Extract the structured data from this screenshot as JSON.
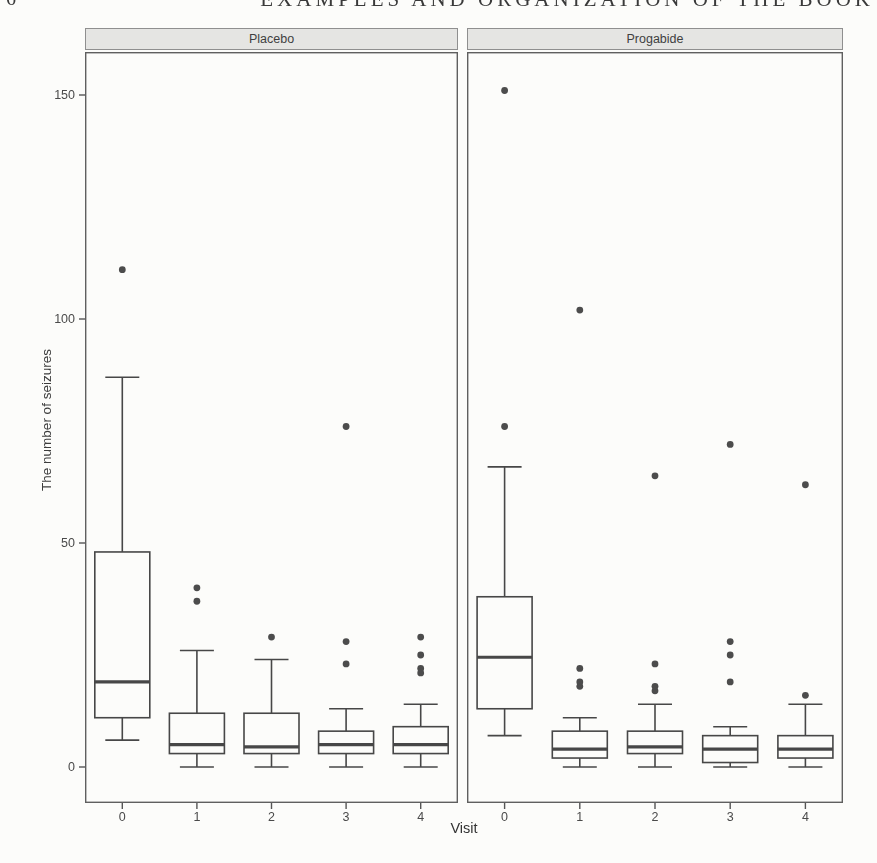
{
  "page": {
    "page_number_fragment": "6",
    "running_header": "EXAMPLES AND ORGANIZATION OF THE BOOK"
  },
  "chart_data": {
    "type": "boxplot",
    "title": "",
    "xlabel": "Visit",
    "ylabel": "The number of seizures",
    "x_categories": [
      "0",
      "1",
      "2",
      "3",
      "4"
    ],
    "y_ticks": [
      0,
      50,
      100,
      150
    ],
    "ylim": [
      -8,
      160
    ],
    "grid": false,
    "legend": "none",
    "facets": [
      {
        "label": "Placebo",
        "boxes": [
          {
            "visit": "0",
            "whisker_low": 6,
            "q1": 11,
            "median": 19,
            "q3": 48,
            "whisker_high": 87,
            "outliers": [
              111
            ]
          },
          {
            "visit": "1",
            "whisker_low": 0,
            "q1": 3,
            "median": 5,
            "q3": 12,
            "whisker_high": 26,
            "outliers": [
              37,
              40
            ]
          },
          {
            "visit": "2",
            "whisker_low": 0,
            "q1": 3,
            "median": 4.5,
            "q3": 12,
            "whisker_high": 24,
            "outliers": [
              29
            ]
          },
          {
            "visit": "3",
            "whisker_low": 0,
            "q1": 3,
            "median": 5,
            "q3": 8,
            "whisker_high": 13,
            "outliers": [
              23,
              28,
              76
            ]
          },
          {
            "visit": "4",
            "whisker_low": 0,
            "q1": 3,
            "median": 5,
            "q3": 9,
            "whisker_high": 14,
            "outliers": [
              21,
              22,
              25,
              29
            ]
          }
        ]
      },
      {
        "label": "Progabide",
        "boxes": [
          {
            "visit": "0",
            "whisker_low": 7,
            "q1": 13,
            "median": 24.5,
            "q3": 38,
            "whisker_high": 67,
            "outliers": [
              76,
              151
            ]
          },
          {
            "visit": "1",
            "whisker_low": 0,
            "q1": 2,
            "median": 4,
            "q3": 8,
            "whisker_high": 11,
            "outliers": [
              18,
              19,
              22,
              102
            ]
          },
          {
            "visit": "2",
            "whisker_low": 0,
            "q1": 3,
            "median": 4.5,
            "q3": 8,
            "whisker_high": 14,
            "outliers": [
              17,
              18,
              23,
              65
            ]
          },
          {
            "visit": "3",
            "whisker_low": 0,
            "q1": 1,
            "median": 4,
            "q3": 7,
            "whisker_high": 9,
            "outliers": [
              19,
              25,
              28,
              72
            ]
          },
          {
            "visit": "4",
            "whisker_low": 0,
            "q1": 2,
            "median": 4,
            "q3": 7,
            "whisker_high": 14,
            "outliers": [
              16,
              63
            ]
          }
        ]
      }
    ],
    "colors": {
      "ink": "#474747",
      "panel_border": "#5f5f5f",
      "strip_fill": "#e5e5e3",
      "strip_border": "#8f8f8f",
      "tick": "#555555",
      "paper": "#fcfcfa"
    }
  }
}
